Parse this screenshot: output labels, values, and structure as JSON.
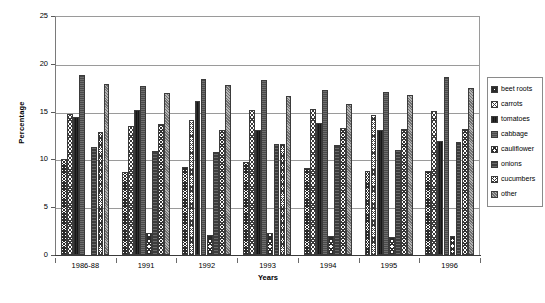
{
  "chart_data": {
    "type": "bar",
    "title": "",
    "xlabel": "Years",
    "ylabel": "Percentage",
    "ylim": [
      0,
      25
    ],
    "yticks": [
      0,
      5,
      10,
      15,
      20,
      25
    ],
    "grid": true,
    "legend_position": "right",
    "categories": [
      "1986-88",
      "1991",
      "1992",
      "1993",
      "1994",
      "1995",
      "1996"
    ],
    "series": [
      {
        "name": "beet roots",
        "values": [
          10.0,
          8.7,
          9.2,
          9.7,
          9.1,
          8.8,
          8.8
        ]
      },
      {
        "name": "carrots",
        "values": [
          14.8,
          13.5,
          14.1,
          15.2,
          15.3,
          14.6,
          15.1
        ]
      },
      {
        "name": "tomatoes",
        "values": [
          14.4,
          15.2,
          16.1,
          13.1,
          13.8,
          13.1,
          11.9
        ]
      },
      {
        "name": "cabbage",
        "values": [
          18.8,
          17.7,
          18.4,
          18.3,
          17.3,
          17.1,
          18.6
        ]
      },
      {
        "name": "cauliflower",
        "values": [
          0.0,
          2.3,
          2.1,
          2.3,
          2.0,
          1.9,
          2.0
        ]
      },
      {
        "name": "onions",
        "values": [
          11.3,
          10.9,
          10.8,
          11.6,
          11.5,
          11.0,
          11.8
        ]
      },
      {
        "name": "cucumbers",
        "values": [
          12.9,
          13.7,
          13.1,
          11.6,
          13.3,
          13.2,
          13.2
        ]
      },
      {
        "name": "other",
        "values": [
          17.9,
          16.9,
          17.8,
          16.6,
          15.8,
          16.7,
          17.5
        ]
      }
    ]
  },
  "legend": {
    "items": [
      {
        "label": "beet roots",
        "pattern": "p-beetroots"
      },
      {
        "label": "carrots",
        "pattern": "p-carrots"
      },
      {
        "label": "tomatoes",
        "pattern": "p-tomatoes"
      },
      {
        "label": "cabbage",
        "pattern": "p-cabbage"
      },
      {
        "label": "cauliflower",
        "pattern": "p-cauliflower"
      },
      {
        "label": "onions",
        "pattern": "p-onions"
      },
      {
        "label": "cucumbers",
        "pattern": "p-cucumbers"
      },
      {
        "label": "other",
        "pattern": "p-other"
      }
    ]
  },
  "colors": {
    "plot_background": "#ffffff",
    "gridline": "#9a9a9a",
    "axis": "#3a3a3a",
    "text": "#000000"
  }
}
